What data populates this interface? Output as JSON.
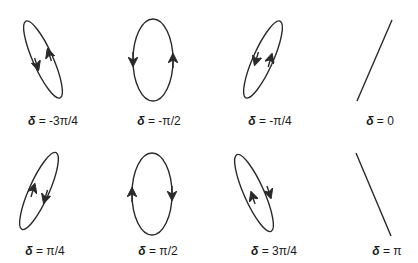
{
  "stroke_color": "#2a2a2a",
  "panels": [
    {
      "id": "p1",
      "delta_symbol": "δ",
      "eq": " = -3π/4",
      "shape": "ellipse",
      "orientation": "tilted-left",
      "rotation": "left-side-down, right-side-up"
    },
    {
      "id": "p2",
      "delta_symbol": "δ",
      "eq": " = -π/2",
      "shape": "ellipse",
      "orientation": "vertical",
      "rotation": "left-side-down, right-side-up"
    },
    {
      "id": "p3",
      "delta_symbol": "δ",
      "eq": " = -π/4",
      "shape": "ellipse",
      "orientation": "tilted-right",
      "rotation": "left-side-down, right-side-up"
    },
    {
      "id": "p4",
      "delta_symbol": "δ",
      "eq": " = 0",
      "shape": "line",
      "orientation": "tilted-right"
    },
    {
      "id": "p5",
      "delta_symbol": "δ",
      "eq": " = π/4",
      "shape": "ellipse",
      "orientation": "tilted-right",
      "rotation": "left-side-up, right-side-down"
    },
    {
      "id": "p6",
      "delta_symbol": "δ",
      "eq": " = π/2",
      "shape": "ellipse",
      "orientation": "vertical",
      "rotation": "left-side-up, right-side-down"
    },
    {
      "id": "p7",
      "delta_symbol": "δ",
      "eq": " = 3π/4",
      "shape": "ellipse",
      "orientation": "tilted-left",
      "rotation": "left-side-up, right-side-down"
    },
    {
      "id": "p8",
      "delta_symbol": "δ",
      "eq": " = π",
      "shape": "line",
      "orientation": "tilted-left"
    }
  ]
}
